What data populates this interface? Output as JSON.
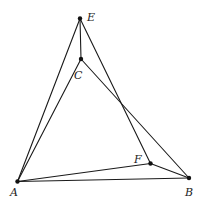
{
  "diagram": {
    "type": "geometry",
    "points": [
      {
        "id": "A",
        "label": "A",
        "x": 17.5,
        "y": 181.5,
        "lx": 10,
        "ly": 196
      },
      {
        "id": "B",
        "label": "B",
        "x": 189,
        "y": 178,
        "lx": 185,
        "ly": 196
      },
      {
        "id": "C",
        "label": "C",
        "x": 81,
        "y": 59,
        "lx": 74,
        "ly": 79
      },
      {
        "id": "E",
        "label": "E",
        "x": 80,
        "y": 18.5,
        "lx": 87,
        "ly": 21
      },
      {
        "id": "F",
        "label": "F",
        "x": 150.5,
        "y": 163.5,
        "lx": 134,
        "ly": 163
      }
    ],
    "segments": [
      [
        "E",
        "A"
      ],
      [
        "E",
        "C"
      ],
      [
        "E",
        "F"
      ],
      [
        "C",
        "A"
      ],
      [
        "C",
        "B"
      ],
      [
        "A",
        "B"
      ],
      [
        "A",
        "F"
      ],
      [
        "F",
        "B"
      ]
    ]
  }
}
